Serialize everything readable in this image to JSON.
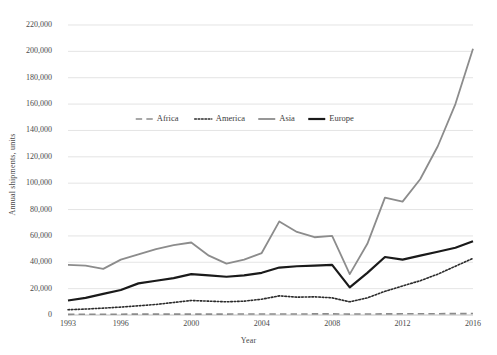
{
  "chart_data": {
    "type": "line",
    "title": "",
    "xlabel": "Year",
    "ylabel": "Annual shipments, units",
    "xlim": [
      1993,
      2016
    ],
    "ylim": [
      0,
      220000
    ],
    "ytick_step": 20000,
    "grid": true,
    "legend_position": "upper-center",
    "x": [
      1993,
      1994,
      1995,
      1996,
      1997,
      1998,
      1999,
      2000,
      2001,
      2002,
      2003,
      2004,
      2005,
      2006,
      2007,
      2008,
      2009,
      2010,
      2011,
      2012,
      2013,
      2014,
      2015,
      2016
    ],
    "xticks": [
      1993,
      1996,
      2000,
      2004,
      2008,
      2012,
      2016
    ],
    "yticks": [
      0,
      20000,
      40000,
      60000,
      80000,
      100000,
      120000,
      140000,
      160000,
      180000,
      200000,
      220000
    ],
    "ytick_labels": [
      "0",
      "20,000",
      "40,000",
      "60,000",
      "80,000",
      "100,000",
      "120,000",
      "140,000",
      "160,000",
      "180,000",
      "200,000",
      "220,000"
    ],
    "series": [
      {
        "name": "Africa",
        "style": "dashed",
        "color": "#8c8c8c",
        "width": 1.6,
        "values": [
          500,
          550,
          600,
          620,
          650,
          640,
          660,
          700,
          680,
          700,
          720,
          750,
          780,
          800,
          820,
          850,
          700,
          780,
          850,
          900,
          950,
          1000,
          1050,
          1100
        ]
      },
      {
        "name": "America",
        "style": "dotted",
        "color": "#2b2b2b",
        "width": 1.6,
        "values": [
          4000,
          4500,
          5200,
          6000,
          7000,
          8000,
          9500,
          11000,
          10500,
          10000,
          10500,
          12000,
          14500,
          13500,
          13800,
          13000,
          10000,
          13000,
          18000,
          22000,
          26000,
          31000,
          37000,
          43000
        ]
      },
      {
        "name": "Asia",
        "style": "solid",
        "color": "#8c8c8c",
        "width": 1.8,
        "values": [
          38000,
          37500,
          35000,
          42000,
          46000,
          50000,
          53000,
          55000,
          45000,
          39000,
          42000,
          47000,
          71000,
          63000,
          59000,
          60000,
          31000,
          54000,
          89000,
          86000,
          103000,
          128000,
          160000,
          202000
        ]
      },
      {
        "name": "Europe",
        "style": "solid",
        "color": "#1a1a1a",
        "width": 2.2,
        "values": [
          11000,
          13000,
          16000,
          19000,
          24000,
          26000,
          28000,
          31000,
          30000,
          29000,
          30000,
          32000,
          36000,
          37000,
          37500,
          38000,
          21000,
          32000,
          44000,
          42000,
          45000,
          48000,
          51000,
          56000
        ]
      }
    ]
  },
  "legend": {
    "items": [
      {
        "label": "Africa"
      },
      {
        "label": "America"
      },
      {
        "label": "Asia"
      },
      {
        "label": "Europe"
      }
    ]
  }
}
